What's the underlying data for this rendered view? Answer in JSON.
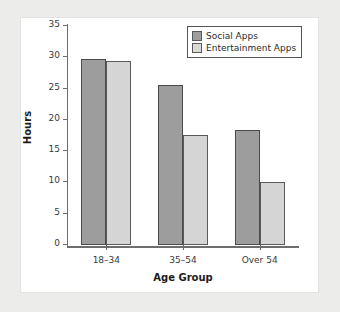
{
  "chart_data": {
    "type": "bar",
    "title": "",
    "categories": [
      "18–34",
      "35–54",
      "Over 54"
    ],
    "series": [
      {
        "name": "Social Apps",
        "values": [
          29.7,
          25.5,
          18.4
        ],
        "color": "#9d9d9d"
      },
      {
        "name": "Entertainment Apps",
        "values": [
          29.4,
          17.6,
          10.1
        ],
        "color": "#d5d5d5"
      }
    ],
    "xlabel": "Age Group",
    "ylabel": "Hours",
    "ylim": [
      0,
      35
    ],
    "ytick_step": 5,
    "yticks": [
      0,
      5,
      10,
      15,
      20,
      25,
      30,
      35
    ],
    "ytick_labels": [
      "0",
      "5",
      "10",
      "15",
      "20",
      "25",
      "30",
      "35"
    ],
    "grid": false,
    "legend_position": "top-right"
  }
}
